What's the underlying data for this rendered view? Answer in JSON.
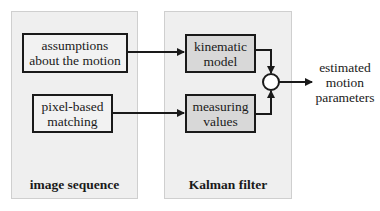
{
  "panels": {
    "left": {
      "label": "image sequence"
    },
    "right": {
      "label": "Kalman filter"
    }
  },
  "boxes": {
    "assumptions": {
      "label": "assumptions about the motion",
      "line1": "assumptions",
      "line2": "about the motion"
    },
    "pixel_matching": {
      "label": "pixel-based matching",
      "line1": "pixel-based",
      "line2": "matching"
    },
    "kinematic_model": {
      "label": "kinematic model",
      "line1": "kinematic",
      "line2": "model"
    },
    "measuring_values": {
      "label": "measuring values",
      "line1": "measuring",
      "line2": "values"
    }
  },
  "output": {
    "line1": "estimated",
    "line2": "motion",
    "line3": "parameters"
  },
  "colors": {
    "panel_bg": "#efefef",
    "box_gray": "#d8d8d8",
    "stroke": "#1a1a1a"
  }
}
